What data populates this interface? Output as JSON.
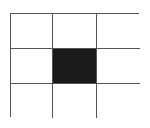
{
  "diagram": {
    "type": "grid",
    "rows": 3,
    "columns": 3,
    "line_color": "#555555",
    "empty_color": "#ffffff",
    "filled_color": "#1a1a1a",
    "cells": [
      {
        "row": 1,
        "col": 1,
        "filled": false
      },
      {
        "row": 1,
        "col": 2,
        "filled": false
      },
      {
        "row": 1,
        "col": 3,
        "filled": false
      },
      {
        "row": 2,
        "col": 1,
        "filled": false
      },
      {
        "row": 2,
        "col": 2,
        "filled": true
      },
      {
        "row": 2,
        "col": 3,
        "filled": false
      },
      {
        "row": 3,
        "col": 1,
        "filled": false
      },
      {
        "row": 3,
        "col": 2,
        "filled": false
      },
      {
        "row": 3,
        "col": 3,
        "filled": false
      }
    ]
  }
}
